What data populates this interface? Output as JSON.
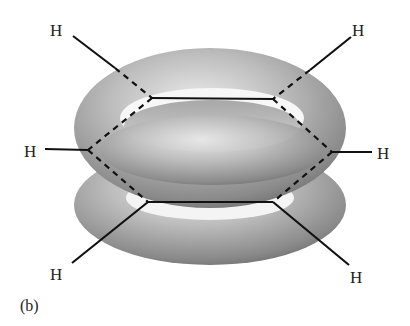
{
  "figure": {
    "panel_label": "(b)",
    "atom_labels": [
      "H",
      "H",
      "H",
      "H",
      "H",
      "H"
    ],
    "colors": {
      "bond": "#111111",
      "torus_light": "#e6e6e6",
      "torus_mid": "#a8a8a8",
      "torus_dark": "#6a6a6a",
      "label": "#222222"
    }
  }
}
